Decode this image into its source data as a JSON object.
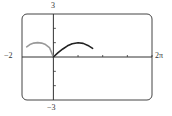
{
  "chart_data": {
    "type": "line",
    "title": "",
    "xlabel": "",
    "ylabel": "",
    "xlim": [
      -2,
      6.2832
    ],
    "ylim": [
      -3,
      3
    ],
    "xlim_labels": {
      "min": "−2",
      "max": "2π"
    },
    "ylim_labels": {
      "min": "−3",
      "max": "3"
    },
    "x_ticks": [
      1.5708,
      3.1416,
      4.7124,
      6.2832
    ],
    "y_ticks": [
      -2,
      -1,
      1,
      2
    ],
    "grid": false,
    "legend": null,
    "series": [
      {
        "name": "left-arc",
        "color": "#999999",
        "description": "Semicircular arc from x≈-1.7 to x=0, peak y≈1 at x≈-1",
        "x": [
          -1.7,
          -1.5,
          -1.25,
          -1.0,
          -0.75,
          -0.5,
          -0.25,
          0.0
        ],
        "y": [
          0.71,
          0.87,
          0.97,
          1.0,
          0.97,
          0.87,
          0.66,
          0.0
        ]
      },
      {
        "name": "right-arc",
        "color": "#222222",
        "description": "Sine-like arch from x=0 to x≈2.5, peak y≈1 at x≈1.57",
        "x": [
          0.0,
          0.3,
          0.6,
          0.9,
          1.2,
          1.5708,
          1.9,
          2.2,
          2.5
        ],
        "y": [
          0.0,
          0.3,
          0.56,
          0.78,
          0.93,
          1.0,
          0.95,
          0.81,
          0.6
        ]
      }
    ]
  },
  "labels": {
    "y_max": "3",
    "y_min": "−3",
    "x_min": "−2",
    "x_max": "2π"
  },
  "colors": {
    "frame": "#444444",
    "axis": "#333333",
    "left_curve": "#999999",
    "right_curve": "#222222"
  }
}
